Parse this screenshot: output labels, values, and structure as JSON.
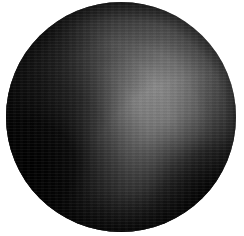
{
  "image": {
    "subject": "shaded-sphere",
    "background_color": "#ffffff",
    "canvas": {
      "width": 244,
      "height": 236
    },
    "disc": {
      "center_x": 121,
      "center_y": 117,
      "radius_x": 115,
      "radius_y": 115
    },
    "texture": "horizontal-scanlines",
    "alt_text": "Grayscale shaded sphere on a white background"
  },
  "shading": {
    "description": "Diffuse sphere with a broad bright lobe below and right of center, very dark lower-left limb and dark lower-right limb",
    "highlight": {
      "x": 118,
      "y": 148,
      "color": "#b4b4b4"
    },
    "secondary_highlight": {
      "x": 160,
      "y": 122,
      "color": "#8c8c8c"
    },
    "midtone": {
      "x": 118,
      "y": 55,
      "color": "#6d6d6d"
    },
    "shadow_left": {
      "x": 30,
      "y": 165,
      "color": "#050505"
    },
    "shadow_bottom_right": {
      "x": 196,
      "y": 186,
      "color": "#0d0d0d"
    },
    "shadow_bottom": {
      "x": 118,
      "y": 224,
      "color": "#101010"
    },
    "limb_top_left": {
      "x": 42,
      "y": 38,
      "color": "#1a1a1a"
    },
    "limb_top_right": {
      "x": 205,
      "y": 42,
      "color": "#3a3a3a"
    },
    "palette": {
      "black": "#000000",
      "near_black": "#070707",
      "dark": "#242424",
      "mid_dark": "#4a4a4a",
      "mid": "#6d6d6d",
      "mid_light": "#8c8c8c",
      "light": "#a6a6a6",
      "brightest": "#b8b8b8",
      "white": "#ffffff"
    }
  }
}
